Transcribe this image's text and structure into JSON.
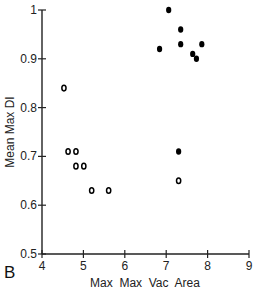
{
  "chart_data": {
    "type": "scatter",
    "title": "",
    "panel_label": "B",
    "xlabel": "Max  Max  Vac  Area",
    "ylabel": "Mean Max DI",
    "xlim": [
      4,
      9
    ],
    "ylim": [
      0.5,
      1.0
    ],
    "x_ticks": [
      "4",
      "5",
      "6",
      "7",
      "8",
      "9"
    ],
    "y_ticks": [
      "0.5",
      "0.6",
      "0.7",
      "0.8",
      "0.9",
      "1"
    ],
    "grid": false,
    "legend": null,
    "series": [
      {
        "name": "open",
        "marker": "hollow",
        "points": [
          {
            "x": 4.53,
            "y": 0.84
          },
          {
            "x": 4.63,
            "y": 0.71
          },
          {
            "x": 4.82,
            "y": 0.71
          },
          {
            "x": 4.82,
            "y": 0.68
          },
          {
            "x": 5.01,
            "y": 0.68
          },
          {
            "x": 5.2,
            "y": 0.63
          },
          {
            "x": 5.61,
            "y": 0.63
          },
          {
            "x": 7.3,
            "y": 0.65
          }
        ]
      },
      {
        "name": "filled",
        "marker": "filled",
        "points": [
          {
            "x": 7.06,
            "y": 1.0
          },
          {
            "x": 7.35,
            "y": 0.96
          },
          {
            "x": 6.84,
            "y": 0.92
          },
          {
            "x": 7.35,
            "y": 0.93
          },
          {
            "x": 7.86,
            "y": 0.93
          },
          {
            "x": 7.64,
            "y": 0.91
          },
          {
            "x": 7.73,
            "y": 0.9
          },
          {
            "x": 7.3,
            "y": 0.71
          }
        ]
      }
    ]
  }
}
